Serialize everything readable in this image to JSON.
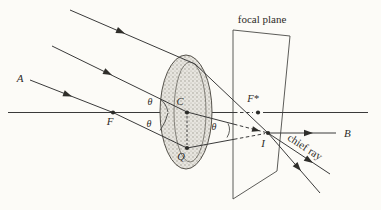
{
  "figure": {
    "type": "optics-lens-diagram",
    "labels": {
      "focal_plane": "focal plane",
      "chief_ray": "chief ray",
      "point_a": "A",
      "point_b": "B",
      "lens_center_c": "C",
      "focal_point_f": "F",
      "focal_point_f_star": "F*",
      "image_point_i": "I",
      "lens_point_q": "Q",
      "theta": "θ"
    },
    "colors": {
      "background": "#fcfbf7",
      "ink": "#3a3a3a",
      "lens_fill": "#e7e5df",
      "lens_stipple": "#98948a"
    }
  }
}
